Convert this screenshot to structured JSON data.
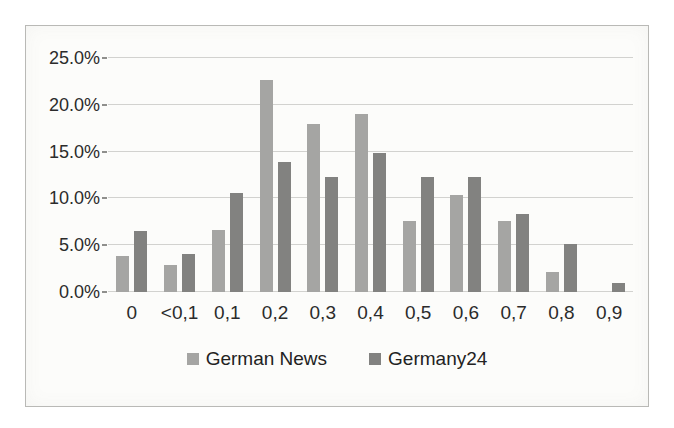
{
  "figure": {
    "background_color": "#ffffff",
    "paper_color": "#fcfcfa",
    "frame_border_color": "#b9b9b6"
  },
  "chart_data": {
    "type": "bar",
    "title": "",
    "xlabel": "",
    "ylabel": "",
    "categories": [
      "0",
      "<0,1",
      "0,1",
      "0,2",
      "0,3",
      "0,4",
      "0,5",
      "0,6",
      "0,7",
      "0,8",
      "0,9"
    ],
    "series": [
      {
        "name": "German News",
        "color": "#a5a5a3",
        "values": [
          3.8,
          2.9,
          6.6,
          22.6,
          18.0,
          19.0,
          7.6,
          10.4,
          7.6,
          2.1,
          0.0
        ]
      },
      {
        "name": "Germany24",
        "color": "#828280",
        "values": [
          6.5,
          4.1,
          10.6,
          13.9,
          12.3,
          14.8,
          12.3,
          12.3,
          8.3,
          5.1,
          1.0
        ]
      }
    ],
    "ylim": [
      0,
      25
    ],
    "ytick_step": 5,
    "ytick_labels": [
      "0.0%",
      "5.0%",
      "10.0%",
      "15.0%",
      "20.0%",
      "25.0%"
    ],
    "grid": true,
    "gridline_color": "#d2d2cf",
    "axis_text_color": "#2b2b2b",
    "legend_position": "bottom"
  }
}
